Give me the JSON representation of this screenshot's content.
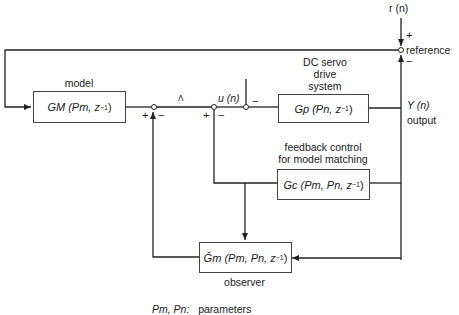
{
  "diagram": {
    "title": "",
    "blocks": {
      "model": {
        "caption": "model",
        "label": "GM (Pm, z",
        "exp": "−1",
        "close": ")"
      },
      "plant": {
        "caption_lines": [
          "DC servo",
          "drive",
          "system"
        ],
        "label": "Gp (Pn, z",
        "exp": "−1",
        "close": ")"
      },
      "controller": {
        "caption_lines": [
          "feedback control",
          "for model matching"
        ],
        "label": "Gc (Pm, Pn, z",
        "exp": "−1",
        "close": ")"
      },
      "observer": {
        "caption": "observer",
        "label": "Ĝm (Pm, Pn, z",
        "exp": "−1",
        "close": ")"
      }
    },
    "signals": {
      "reference_input": "r (n)",
      "reference": "reference",
      "control": "u (n)",
      "output_symbol": "Y (n)",
      "output": "output",
      "small_mark": "ᐱ"
    },
    "signs": {
      "ref_plus": "+",
      "ref_minus": "−",
      "j1_plus": "+",
      "j1_minus": "−",
      "j2_plus": "+",
      "j2_minus": "−",
      "j3_minus": "−"
    },
    "footnote": {
      "symbols": "Pm, Pn:",
      "text": "parameters"
    }
  }
}
